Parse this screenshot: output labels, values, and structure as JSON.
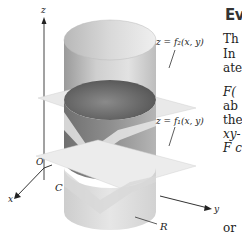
{
  "figure": {
    "axes": {
      "z": "z",
      "x": "x",
      "y": "y",
      "origin": "O"
    },
    "labels": {
      "upper_surface": "z = f₂(x,  y)",
      "lower_surface": "z = f₁(x,  y)",
      "curve": "C",
      "region": "R"
    }
  },
  "text_column": {
    "heading": "Ev",
    "lines": [
      "Th",
      "In",
      "ate",
      "F(",
      "ab",
      "the",
      "xy-",
      "F c",
      "or"
    ]
  }
}
